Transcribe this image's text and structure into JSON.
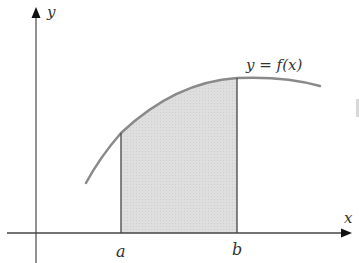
{
  "diagram": {
    "axes": {
      "x_label": "x",
      "y_label": "y"
    },
    "curve_label": "y = f(x)",
    "bounds": {
      "lower": "a",
      "upper": "b"
    },
    "colors": {
      "curve": "#8a8a8a",
      "fill": "#dcdcdc",
      "axis": "#444444",
      "text": "#333333"
    }
  }
}
